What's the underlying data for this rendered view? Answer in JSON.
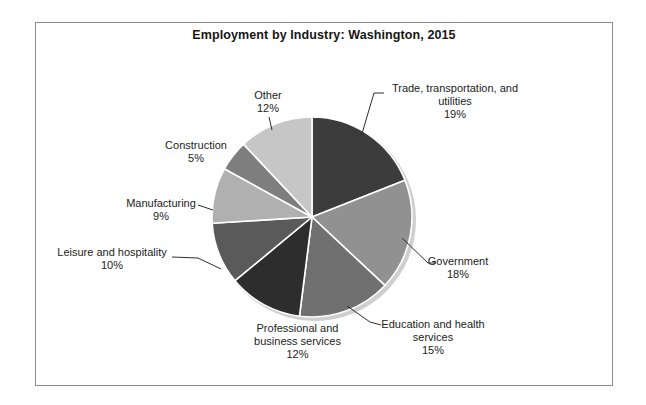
{
  "chart_data": {
    "type": "pie",
    "title": "Employment by Industry: Washington, 2015",
    "direction": "clockwise",
    "start_angle_deg": 0,
    "legend": "none",
    "label_style": "outside-with-leader-lines",
    "units": "percent of employment",
    "segments": [
      {
        "label": "Trade, transportation, and utilities",
        "pct_label": "19%",
        "value": 19,
        "color": "#3c3c3c"
      },
      {
        "label": "Government",
        "pct_label": "18%",
        "value": 18,
        "color": "#919191"
      },
      {
        "label": "Education and health services",
        "pct_label": "15%",
        "value": 15,
        "color": "#707070"
      },
      {
        "label": "Professional and business services",
        "pct_label": "12%",
        "value": 12,
        "color": "#2d2d2d"
      },
      {
        "label": "Leisure and hospitality",
        "pct_label": "10%",
        "value": 10,
        "color": "#5a5a5a"
      },
      {
        "label": "Manufacturing",
        "pct_label": "9%",
        "value": 9,
        "color": "#b0b0b0"
      },
      {
        "label": "Construction",
        "pct_label": "5%",
        "value": 5,
        "color": "#7e7e7e"
      },
      {
        "label": "Other",
        "pct_label": "12%",
        "value": 12,
        "color": "#c6c6c6"
      }
    ],
    "slice_border_color": "#ffffff",
    "shadow_color": "#cfcfcf"
  }
}
